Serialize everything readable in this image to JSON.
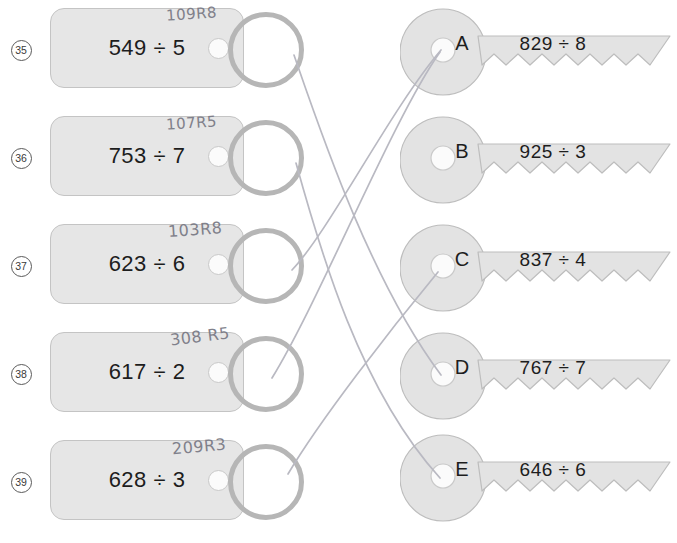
{
  "worksheet": {
    "title": "Division Key Match Worksheet",
    "divide_symbol": "÷"
  },
  "left_column": {
    "items": [
      {
        "number": "35",
        "problem": "549 ÷ 5",
        "handwritten_answer": "109R8"
      },
      {
        "number": "36",
        "problem": "753 ÷ 7",
        "handwritten_answer": "107R5"
      },
      {
        "number": "37",
        "problem": "623 ÷ 6",
        "handwritten_answer": "103R8"
      },
      {
        "number": "38",
        "problem": "617 ÷ 2",
        "handwritten_answer": "308 R5"
      },
      {
        "number": "39",
        "problem": "628 ÷ 3",
        "handwritten_answer": "209R3"
      }
    ]
  },
  "right_column": {
    "items": [
      {
        "letter": "A",
        "problem": "829 ÷ 8"
      },
      {
        "letter": "B",
        "problem": "925 ÷ 3"
      },
      {
        "letter": "C",
        "problem": "837 ÷ 4"
      },
      {
        "letter": "D",
        "problem": "767 ÷ 7"
      },
      {
        "letter": "E",
        "problem": "646 ÷ 6"
      }
    ]
  },
  "connections": [
    {
      "from": "35",
      "to": "D"
    },
    {
      "from": "36",
      "to": "E"
    },
    {
      "from": "37",
      "to": "A"
    },
    {
      "from": "38",
      "to": "A"
    },
    {
      "from": "39",
      "to": "C"
    }
  ],
  "colors": {
    "tag_fill": "#e6e6e6",
    "tag_stroke": "#c4c4c4",
    "ring_stroke": "#b6b6b6",
    "key_fill": "#e3e3e3",
    "key_stroke": "#bdbdbd",
    "text": "#1d1d1d",
    "pencil": "#b9b9c2",
    "handwriting": "#7b7b86"
  }
}
